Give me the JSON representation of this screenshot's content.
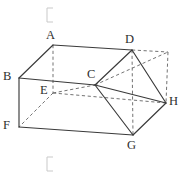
{
  "figure": {
    "kind": "geometry-solid-diagram",
    "canvas": {
      "width": 184,
      "height": 177
    },
    "colors": {
      "background": "#ffffff",
      "visible_edge": "#3a3a3a",
      "hidden_edge": "#6b6b6b",
      "label_text": "#2e2e2e",
      "bracket_mark": "#c9c9c9"
    },
    "vertices": [
      {
        "id": "A",
        "label": "A",
        "x": 53,
        "y": 45,
        "label_x": 46,
        "label_y": 29
      },
      {
        "id": "B",
        "label": "B",
        "x": 19,
        "y": 78,
        "label_x": 3,
        "label_y": 70
      },
      {
        "id": "C",
        "label": "C",
        "x": 95,
        "y": 85,
        "label_x": 87,
        "label_y": 68
      },
      {
        "id": "D",
        "label": "D",
        "x": 132,
        "y": 50,
        "label_x": 125,
        "label_y": 33
      },
      {
        "id": "E",
        "label": "E",
        "x": 53,
        "y": 93,
        "label_x": 40,
        "label_y": 84
      },
      {
        "id": "F",
        "label": "F",
        "x": 19,
        "y": 127,
        "label_x": 3,
        "label_y": 119
      },
      {
        "id": "G",
        "label": "G",
        "x": 133,
        "y": 135,
        "label_x": 127,
        "label_y": 139
      },
      {
        "id": "H",
        "label": "H",
        "x": 166,
        "y": 103,
        "label_x": 169,
        "label_y": 95
      },
      {
        "id": "P",
        "label": "",
        "x": 168,
        "y": 52,
        "label_x": 0,
        "label_y": 0
      }
    ],
    "edges_visible": [
      {
        "from": "A",
        "to": "B",
        "name": "edge-a-b"
      },
      {
        "from": "A",
        "to": "D",
        "name": "edge-a-d"
      },
      {
        "from": "B",
        "to": "C",
        "name": "edge-b-c"
      },
      {
        "from": "B",
        "to": "F",
        "name": "edge-b-f"
      },
      {
        "from": "C",
        "to": "D",
        "name": "edge-c-d"
      },
      {
        "from": "C",
        "to": "G",
        "name": "edge-c-g"
      },
      {
        "from": "D",
        "to": "H",
        "name": "edge-d-h"
      },
      {
        "from": "F",
        "to": "G",
        "name": "edge-f-g"
      },
      {
        "from": "G",
        "to": "H",
        "name": "edge-g-h"
      },
      {
        "from": "C",
        "to": "H",
        "name": "edge-c-h"
      }
    ],
    "edges_hidden": [
      {
        "from": "A",
        "to": "E",
        "name": "edge-a-e"
      },
      {
        "from": "E",
        "to": "F",
        "name": "edge-e-f"
      },
      {
        "from": "E",
        "to": "C",
        "name": "edge-e-c"
      },
      {
        "from": "E",
        "to": "H",
        "name": "edge-e-h"
      },
      {
        "from": "C",
        "to": "P",
        "name": "edge-c-p"
      },
      {
        "from": "D",
        "to": "P",
        "name": "edge-d-p"
      },
      {
        "from": "P",
        "to": "H",
        "name": "edge-p-h"
      },
      {
        "from": "D",
        "to": "G",
        "name": "edge-d-g"
      }
    ],
    "brackets": [
      {
        "name": "top-bracket-mark",
        "x": 47,
        "y": 8,
        "w": 6,
        "h": 14
      },
      {
        "name": "bottom-bracket-mark",
        "x": 47,
        "y": 157,
        "w": 6,
        "h": 14
      }
    ]
  }
}
